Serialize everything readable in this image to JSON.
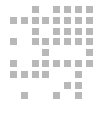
{
  "canvas": {
    "width": 101,
    "height": 127,
    "background_color": "#ffffff",
    "label": "matrix-code-pattern"
  },
  "pattern": {
    "name": "data-matrix-code",
    "module_color": "#b8b8b8",
    "module_size": 7,
    "module_pitch": 10.8,
    "origin_x": 10,
    "origin_y": 6,
    "columns": 8,
    "rows": 9,
    "total_modules_filled": 47,
    "modules": [
      [
        0,
        2
      ],
      [
        0,
        4
      ],
      [
        0,
        5
      ],
      [
        0,
        6
      ],
      [
        0,
        7
      ],
      [
        1,
        0
      ],
      [
        1,
        1
      ],
      [
        1,
        2
      ],
      [
        1,
        3
      ],
      [
        1,
        4
      ],
      [
        1,
        5
      ],
      [
        1,
        6
      ],
      [
        1,
        7
      ],
      [
        2,
        2
      ],
      [
        2,
        4
      ],
      [
        2,
        5
      ],
      [
        2,
        6
      ],
      [
        2,
        7
      ],
      [
        3,
        0
      ],
      [
        3,
        2
      ],
      [
        3,
        3
      ],
      [
        3,
        4
      ],
      [
        3,
        5
      ],
      [
        3,
        6
      ],
      [
        3,
        7
      ],
      [
        4,
        3
      ],
      [
        4,
        7
      ],
      [
        5,
        0
      ],
      [
        5,
        2
      ],
      [
        5,
        3
      ],
      [
        5,
        4
      ],
      [
        5,
        5
      ],
      [
        5,
        6
      ],
      [
        5,
        7
      ],
      [
        6,
        0
      ],
      [
        6,
        1
      ],
      [
        6,
        2
      ],
      [
        6,
        3
      ],
      [
        6,
        6
      ],
      [
        7,
        5
      ],
      [
        7,
        6
      ],
      [
        8,
        1
      ],
      [
        8,
        4
      ],
      [
        8,
        6
      ]
    ]
  }
}
